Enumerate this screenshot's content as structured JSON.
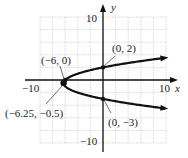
{
  "chart_data": {
    "type": "line",
    "title": "",
    "equation": "x = y^2 + y - 6",
    "xlabel": "x",
    "ylabel": "y",
    "xlim": [
      -10,
      10
    ],
    "ylim": [
      -10,
      10
    ],
    "grid": true,
    "x_tick_labels": [
      "-10",
      "10"
    ],
    "y_tick_labels": [
      "10",
      "-10"
    ],
    "series": [
      {
        "name": "parabola",
        "curve": "x = y^2 + y - 6",
        "y_range": [
          -4.5,
          3.5
        ]
      }
    ],
    "points": [
      {
        "x": -6,
        "y": 0,
        "label": "(−6, 0)"
      },
      {
        "x": 0,
        "y": 2,
        "label": "(0, 2)"
      },
      {
        "x": -6.25,
        "y": -0.5,
        "label": "(−6.25, −0.5)"
      },
      {
        "x": 0,
        "y": -3,
        "label": "(0, −3)"
      }
    ]
  },
  "labels": {
    "x_axis": "x",
    "y_axis": "y",
    "x_min": "−10",
    "x_max": "10",
    "y_max": "10",
    "y_min": "−10",
    "p1": "(−6, 0)",
    "p2": "(0, 2)",
    "p3": "(−6.25, −0.5)",
    "p4": "(0, −3)"
  }
}
